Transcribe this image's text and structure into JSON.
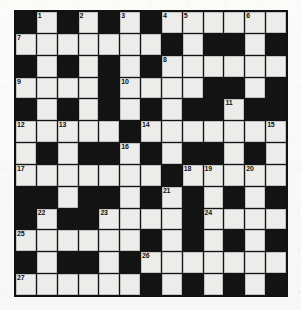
{
  "puzzle": {
    "type": "crossword-grid",
    "title": "",
    "columns": 13,
    "rows": 13,
    "colors": {
      "block": "#131313",
      "light": "#ececea",
      "border": "#111111",
      "number": "#101010",
      "paper": "#fbfbf9"
    },
    "legend": {
      "white": "open letter square",
      "black": "blocked square"
    },
    "grid": [
      [
        "black",
        "white",
        "black",
        "white",
        "black",
        "white",
        "black",
        "white",
        "white",
        "white",
        "white",
        "white",
        "white"
      ],
      [
        "white",
        "white",
        "white",
        "white",
        "white",
        "white",
        "white",
        "black",
        "white",
        "black",
        "black",
        "white",
        "black"
      ],
      [
        "black",
        "white",
        "black",
        "white",
        "black",
        "white",
        "black",
        "white",
        "white",
        "white",
        "white",
        "white",
        "white"
      ],
      [
        "white",
        "white",
        "white",
        "white",
        "black",
        "white",
        "white",
        "white",
        "white",
        "black",
        "black",
        "white",
        "black"
      ],
      [
        "black",
        "white",
        "black",
        "white",
        "black",
        "white",
        "black",
        "white",
        "black",
        "black",
        "white",
        "black",
        "black"
      ],
      [
        "white",
        "white",
        "white",
        "white",
        "white",
        "black",
        "white",
        "white",
        "white",
        "white",
        "white",
        "white",
        "white"
      ],
      [
        "white",
        "black",
        "white",
        "black",
        "black",
        "white",
        "black",
        "white",
        "black",
        "black",
        "white",
        "black",
        "white"
      ],
      [
        "white",
        "white",
        "white",
        "white",
        "white",
        "white",
        "white",
        "black",
        "white",
        "white",
        "white",
        "white",
        "white"
      ],
      [
        "black",
        "black",
        "white",
        "black",
        "black",
        "white",
        "black",
        "white",
        "black",
        "white",
        "black",
        "white",
        "black"
      ],
      [
        "black",
        "white",
        "black",
        "black",
        "white",
        "white",
        "white",
        "white",
        "black",
        "white",
        "white",
        "white",
        "white"
      ],
      [
        "white",
        "white",
        "white",
        "white",
        "white",
        "white",
        "black",
        "white",
        "black",
        "white",
        "black",
        "white",
        "black"
      ],
      [
        "black",
        "white",
        "black",
        "black",
        "white",
        "black",
        "white",
        "white",
        "white",
        "white",
        "white",
        "white",
        "white"
      ],
      [
        "white",
        "white",
        "white",
        "white",
        "white",
        "white",
        "black",
        "white",
        "black",
        "white",
        "black",
        "white",
        "black"
      ]
    ],
    "clue_numbers": [
      {
        "number": "1",
        "row": 1,
        "col": 2
      },
      {
        "number": "2",
        "row": 1,
        "col": 4
      },
      {
        "number": "3",
        "row": 1,
        "col": 6
      },
      {
        "number": "4",
        "row": 1,
        "col": 8
      },
      {
        "number": "5",
        "row": 1,
        "col": 9
      },
      {
        "number": "6",
        "row": 1,
        "col": 12
      },
      {
        "number": "7",
        "row": 2,
        "col": 1
      },
      {
        "number": "8",
        "row": 3,
        "col": 8
      },
      {
        "number": "9",
        "row": 4,
        "col": 1
      },
      {
        "number": "10",
        "row": 4,
        "col": 6
      },
      {
        "number": "11",
        "row": 5,
        "col": 11
      },
      {
        "number": "12",
        "row": 6,
        "col": 1
      },
      {
        "number": "13",
        "row": 6,
        "col": 3
      },
      {
        "number": "14",
        "row": 6,
        "col": 7
      },
      {
        "number": "15",
        "row": 6,
        "col": 13
      },
      {
        "number": "16",
        "row": 7,
        "col": 6
      },
      {
        "number": "17",
        "row": 8,
        "col": 1
      },
      {
        "number": "18",
        "row": 8,
        "col": 9
      },
      {
        "number": "19",
        "row": 8,
        "col": 10
      },
      {
        "number": "20",
        "row": 8,
        "col": 12
      },
      {
        "number": "21",
        "row": 9,
        "col": 8
      },
      {
        "number": "22",
        "row": 10,
        "col": 2
      },
      {
        "number": "23",
        "row": 10,
        "col": 5
      },
      {
        "number": "24",
        "row": 10,
        "col": 10
      },
      {
        "number": "25",
        "row": 11,
        "col": 1
      },
      {
        "number": "26",
        "row": 12,
        "col": 7
      },
      {
        "number": "27",
        "row": 13,
        "col": 1
      }
    ]
  }
}
